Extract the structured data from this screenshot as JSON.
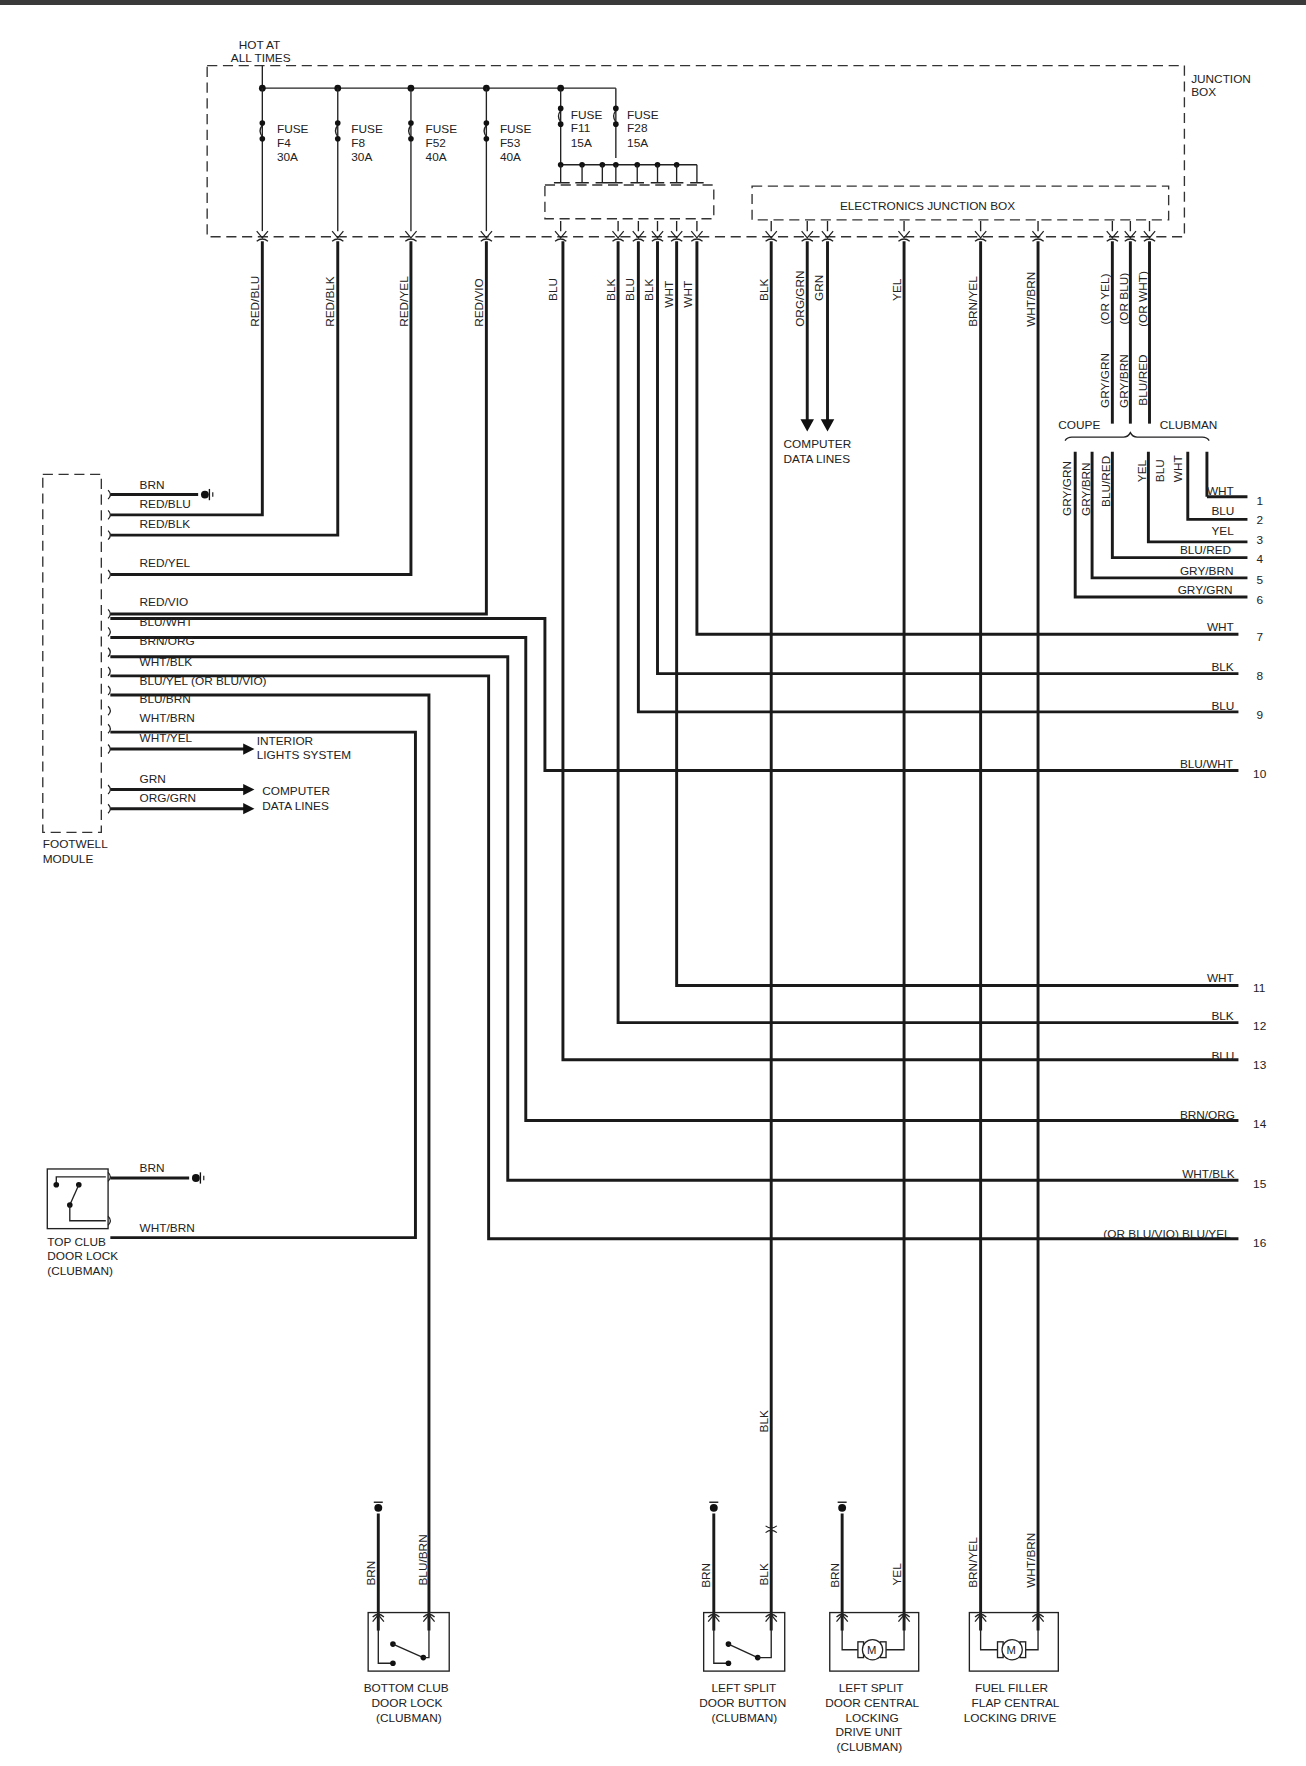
{
  "power": {
    "label_line1": "HOT AT",
    "label_line2": "ALL TIMES"
  },
  "junction_box": {
    "label_line1": "JUNCTION",
    "label_line2": "BOX"
  },
  "electronics_junction_box": {
    "label": "ELECTRONICS JUNCTION BOX"
  },
  "fuses": [
    {
      "l1": "FUSE",
      "l2": "F4",
      "l3": "30A"
    },
    {
      "l1": "FUSE",
      "l2": "F8",
      "l3": "30A"
    },
    {
      "l1": "FUSE",
      "l2": "F52",
      "l3": "40A"
    },
    {
      "l1": "FUSE",
      "l2": "F53",
      "l3": "40A"
    },
    {
      "l1": "FUSE",
      "l2": "F11",
      "l3": "15A"
    },
    {
      "l1": "FUSE",
      "l2": "F28",
      "l3": "15A"
    }
  ],
  "vertical_wires": {
    "red_blu": "RED/BLU",
    "red_blk": "RED/BLK",
    "red_yel": "RED/YEL",
    "red_vio": "RED/VIO",
    "blu1": "BLU",
    "blk1": "BLK",
    "blu2": "BLU",
    "blk2": "BLK",
    "wht1": "WHT",
    "wht2": "WHT",
    "blk3": "BLK",
    "org_grn": "ORG/GRN",
    "grn": "GRN",
    "yel": "YEL",
    "brn_yel": "BRN/YEL",
    "wht_brn": "WHT/BRN",
    "gry_grn": "GRY/GRN",
    "or_yel": "(OR YEL)",
    "gry_brn": "GRY/BRN",
    "or_blu": "(OR BLU)",
    "blu_red": "BLU/RED",
    "or_wht": "(OR WHT)"
  },
  "computer_data_lines_top": {
    "l1": "COMPUTER",
    "l2": "DATA LINES"
  },
  "variants": {
    "coupe": "COUPE",
    "clubman": "CLUBMAN"
  },
  "coupe_wires": [
    "GRY/GRN",
    "GRY/BRN",
    "BLU/RED"
  ],
  "clubman_wires": [
    "YEL",
    "BLU",
    "WHT"
  ],
  "connector_pins": [
    {
      "num": "1",
      "color": "WHT"
    },
    {
      "num": "2",
      "color": "BLU"
    },
    {
      "num": "3",
      "color": "YEL"
    },
    {
      "num": "4",
      "color": "BLU/RED"
    },
    {
      "num": "5",
      "color": "GRY/BRN"
    },
    {
      "num": "6",
      "color": "GRY/GRN"
    },
    {
      "num": "7",
      "color": "WHT"
    },
    {
      "num": "8",
      "color": "BLK"
    },
    {
      "num": "9",
      "color": "BLU"
    },
    {
      "num": "10",
      "color": "BLU/WHT"
    },
    {
      "num": "11",
      "color": "WHT"
    },
    {
      "num": "12",
      "color": "BLK"
    },
    {
      "num": "13",
      "color": "BLU"
    },
    {
      "num": "14",
      "color": "BRN/ORG"
    },
    {
      "num": "15",
      "color": "WHT/BLK"
    },
    {
      "num": "16",
      "color": "(OR BLU/VIO) BLU/YEL"
    }
  ],
  "footwell_module": {
    "label_line1": "FOOTWELL",
    "label_line2": "MODULE",
    "wires": [
      "BRN",
      "RED/BLU",
      "RED/BLK",
      "RED/YEL",
      "RED/VIO",
      "BLU/WHT",
      "BRN/ORG",
      "WHT/BLK",
      "BLU/YEL (OR BLU/VIO)",
      "BLU/BRN",
      "WHT/BRN",
      "WHT/YEL",
      "GRN",
      "ORG/GRN"
    ],
    "interior_lights": {
      "l1": "INTERIOR",
      "l2": "LIGHTS SYSTEM"
    },
    "computer_data_lines": {
      "l1": "COMPUTER",
      "l2": "DATA LINES"
    }
  },
  "top_club_door_lock": {
    "l1": "TOP CLUB",
    "l2": "DOOR LOCK",
    "l3": "(CLUBMAN)",
    "wire_top": "BRN",
    "wire_bottom": "WHT/BRN"
  },
  "components_bottom": [
    {
      "l1": "BOTTOM CLUB",
      "l2": "DOOR LOCK",
      "l3": "(CLUBMAN)",
      "l4": "",
      "l5": "",
      "wire_a": "BRN",
      "wire_b": "BLU/BRN"
    },
    {
      "l1": "LEFT SPLIT",
      "l2": "DOOR BUTTON",
      "l3": "(CLUBMAN)",
      "l4": "",
      "l5": "",
      "wire_a": "BRN",
      "wire_b": "BLK"
    },
    {
      "l1": "LEFT SPLIT",
      "l2": "DOOR CENTRAL",
      "l3": "LOCKING",
      "l4": "DRIVE UNIT",
      "l5": "(CLUBMAN)",
      "wire_a": "BRN",
      "wire_b": "YEL"
    },
    {
      "l1": "FUEL FILLER",
      "l2": "FLAP CENTRAL",
      "l3": "LOCKING DRIVE",
      "l4": "",
      "l5": "",
      "wire_a": "BRN/YEL",
      "wire_b": "WHT/BRN"
    }
  ],
  "mid_wire_label": "BLK",
  "motor_symbol": "M"
}
